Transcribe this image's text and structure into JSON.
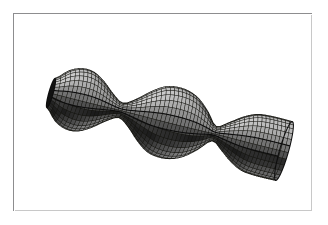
{
  "figure": {
    "caption": "",
    "background_color": "#ffffff",
    "frame": {
      "border_color": "#8d8d8f",
      "shadow_color": "#c8c8c8",
      "x": 13,
      "y": 13,
      "width": 299,
      "height": 198
    }
  },
  "chart_data": {
    "type": "surface3d",
    "title": "",
    "subtitle": "",
    "xlabel": "",
    "ylabel": "",
    "zlabel": "",
    "description": "Shaded quadrilateral-mesh rendering of a surface of revolution consisting of three bulbs joined by two narrow necks (a Delaunay-type unduloid / nodoid chain), drawn in perspective along an axis tilted from upper-left to lower-right; the right-hand end is an open flared funnel revealing the bright interior of the tube.",
    "surface_name": "triple-bulb surface of revolution",
    "axis": {
      "start_point": [
        50,
        92
      ],
      "end_point": [
        283,
        150
      ],
      "tilt_degrees": 14,
      "length_px": 240
    },
    "mesh": {
      "meridians": 28,
      "parallels": 60,
      "line_color": "#14140f",
      "line_width_px": 0.5,
      "shading": "lambertian-greyscale"
    },
    "lighting": {
      "model": "diffuse",
      "light_direction": [
        -0.25,
        -0.85,
        0.47
      ],
      "ambient": 0.06,
      "diffuse": 0.94,
      "specular": 0.0
    },
    "palette": {
      "highlight": "#d8d8d8",
      "midtone": "#6e6e6e",
      "shadow": "#2a2a2a",
      "deep_shadow": "#111111",
      "interior_highlight": "#e3e3e3",
      "interior_shadow": "#5a5a5a",
      "silhouette": "#0c0c0c"
    },
    "profile": {
      "parameter": "t",
      "t_range": [
        0.0,
        1.0
      ],
      "radius_label": "r(t)",
      "bulbs": [
        {
          "index": 1,
          "center_t": 0.115,
          "max_radius_px": 31.0,
          "axis_point": [
            63,
            96
          ]
        },
        {
          "index": 2,
          "center_t": 0.5,
          "max_radius_px": 35.5,
          "axis_point": [
            153,
            118
          ]
        },
        {
          "index": 3,
          "center_t": 0.885,
          "max_radius_px": 30.0,
          "axis_point": [
            246,
            141
          ]
        }
      ],
      "necks": [
        {
          "index": 1,
          "t": 0.3,
          "min_radius_px": 7.5,
          "axis_point": [
            112,
            107
          ]
        },
        {
          "index": 2,
          "t": 0.7,
          "min_radius_px": 7.5,
          "axis_point": [
            205,
            130
          ]
        }
      ],
      "ends": [
        {
          "side": "left",
          "t": 0.0,
          "radius_px": 15.0,
          "open": false,
          "cap": "closed-flare"
        },
        {
          "side": "right",
          "t": 1.0,
          "radius_px": 30.0,
          "open": true,
          "cap": "open-funnel"
        }
      ],
      "samples_t": [
        0.0,
        0.05,
        0.1,
        0.15,
        0.2,
        0.25,
        0.3,
        0.35,
        0.4,
        0.45,
        0.5,
        0.55,
        0.6,
        0.65,
        0.7,
        0.75,
        0.8,
        0.85,
        0.9,
        0.95,
        1.0
      ],
      "samples_radius_px": [
        15.0,
        26.0,
        30.8,
        30.0,
        23.5,
        14.0,
        7.5,
        14.5,
        25.0,
        33.0,
        35.5,
        34.5,
        29.5,
        19.5,
        7.5,
        14.5,
        23.0,
        28.5,
        30.0,
        30.2,
        30.0
      ]
    },
    "grid": false,
    "legend": null,
    "axes_visible": false
  }
}
